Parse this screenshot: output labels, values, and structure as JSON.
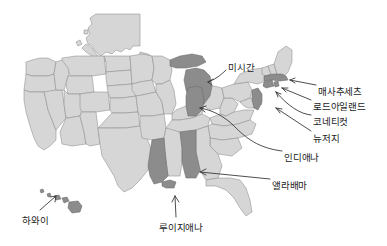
{
  "figure": {
    "type": "choropleth-map",
    "region": "United States",
    "background_color": "#ffffff",
    "base_state_color": "#d6d6d6",
    "highlight_state_color": "#8c8c8c",
    "border_color": "#8e8e8e",
    "label_color": "#1c1c1c",
    "leader_line_color": "#3a3a3a"
  },
  "labels": [
    {
      "id": "michigan",
      "text": "미시간",
      "x": 228,
      "y": 63,
      "align": "left"
    },
    {
      "id": "massachusetts",
      "text": "매사추세츠",
      "x": 318,
      "y": 87,
      "align": "left"
    },
    {
      "id": "rhode-island",
      "text": "로드아일랜드",
      "x": 313,
      "y": 102,
      "align": "left"
    },
    {
      "id": "connecticut",
      "text": "코네티컷",
      "x": 313,
      "y": 117,
      "align": "left"
    },
    {
      "id": "new-jersey",
      "text": "뉴저지",
      "x": 313,
      "y": 134,
      "align": "left"
    },
    {
      "id": "indiana",
      "text": "인디애나",
      "x": 284,
      "y": 153,
      "align": "left"
    },
    {
      "id": "alabama",
      "text": "앨라배마",
      "x": 272,
      "y": 181,
      "align": "left"
    },
    {
      "id": "hawaii",
      "text": "하와이",
      "x": 22,
      "y": 216,
      "align": "left"
    },
    {
      "id": "louisiana",
      "text": "루이지애나",
      "x": 159,
      "y": 223,
      "align": "left"
    }
  ],
  "highlighted_states": [
    {
      "id": "michigan",
      "label": "미시간"
    },
    {
      "id": "indiana",
      "label": "인디애나"
    },
    {
      "id": "massachusetts",
      "label": "매사추세츠"
    },
    {
      "id": "rhode-island",
      "label": "로드아일랜드"
    },
    {
      "id": "connecticut",
      "label": "코네티컷"
    },
    {
      "id": "new-jersey",
      "label": "뉴저지"
    },
    {
      "id": "alabama",
      "label": "앨라배마"
    },
    {
      "id": "louisiana",
      "label": "루이지애나"
    },
    {
      "id": "hawaii",
      "label": "하와이"
    }
  ]
}
